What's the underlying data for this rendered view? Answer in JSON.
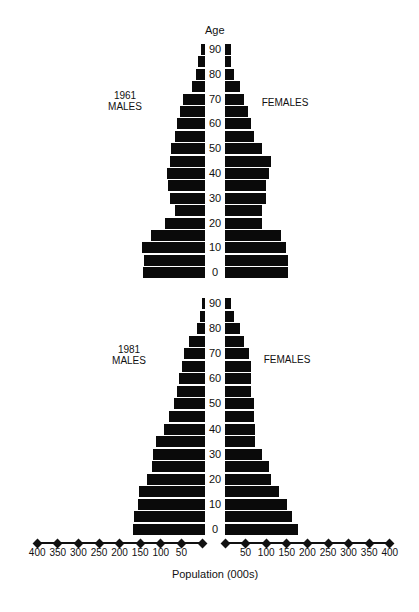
{
  "header": {
    "age_label": "Age"
  },
  "panels": [
    {
      "year": "1961",
      "males_label": "MALES",
      "females_label": "FEMALES"
    },
    {
      "year": "1981",
      "males_label": "MALES",
      "females_label": "FEMALES"
    }
  ],
  "age_ticks": [
    "90",
    "80",
    "70",
    "60",
    "50",
    "40",
    "30",
    "20",
    "10",
    "0"
  ],
  "axis": {
    "title": "Population (000s)",
    "left_ticks": [
      "400",
      "350",
      "300",
      "250",
      "200",
      "150",
      "100",
      "50"
    ],
    "right_ticks": [
      "50",
      "100",
      "150",
      "200",
      "250",
      "300",
      "350",
      "400"
    ]
  },
  "chart_data": [
    {
      "type": "bar",
      "orientation": "horizontal",
      "subtype": "population-pyramid",
      "title": "1961",
      "xlabel": "Population (000s)",
      "ylabel": "Age",
      "xlim": [
        -400,
        400
      ],
      "categories": [
        "90",
        "85",
        "80",
        "75",
        "70",
        "65",
        "60",
        "55",
        "50",
        "45",
        "40",
        "35",
        "30",
        "25",
        "20",
        "15",
        "10",
        "5",
        "0"
      ],
      "series": [
        {
          "name": "MALES",
          "values": [
            10,
            16,
            21,
            31,
            53,
            60,
            67,
            72,
            82,
            85,
            92,
            90,
            85,
            73,
            97,
            131,
            153,
            148,
            150
          ]
        },
        {
          "name": "FEMALES",
          "values": [
            15,
            15,
            22,
            36,
            46,
            56,
            63,
            70,
            90,
            112,
            107,
            100,
            100,
            90,
            90,
            136,
            148,
            153,
            153
          ]
        }
      ],
      "y_tick_labels": [
        "90",
        "80",
        "70",
        "60",
        "50",
        "40",
        "30",
        "20",
        "10",
        "0"
      ],
      "grid": false
    },
    {
      "type": "bar",
      "orientation": "horizontal",
      "subtype": "population-pyramid",
      "title": "1981",
      "xlabel": "Population (000s)",
      "ylabel": "Age",
      "xlim": [
        -400,
        400
      ],
      "x_tick_labels": [
        "400",
        "350",
        "300",
        "250",
        "200",
        "150",
        "100",
        "50",
        "50",
        "100",
        "150",
        "200",
        "250",
        "300",
        "350",
        "400"
      ],
      "categories": [
        "90",
        "85",
        "80",
        "75",
        "70",
        "65",
        "60",
        "55",
        "50",
        "45",
        "40",
        "35",
        "30",
        "25",
        "20",
        "15",
        "10",
        "5",
        "0"
      ],
      "series": [
        {
          "name": "MALES",
          "values": [
            7,
            12,
            19,
            39,
            51,
            56,
            63,
            68,
            75,
            87,
            100,
            119,
            126,
            129,
            141,
            160,
            163,
            172,
            175
          ]
        },
        {
          "name": "FEMALES",
          "values": [
            15,
            22,
            36,
            46,
            58,
            63,
            63,
            63,
            70,
            70,
            73,
            73,
            90,
            107,
            112,
            131,
            150,
            163,
            177
          ]
        }
      ],
      "y_tick_labels": [
        "90",
        "80",
        "70",
        "60",
        "50",
        "40",
        "30",
        "20",
        "10",
        "0"
      ],
      "grid": false
    }
  ]
}
